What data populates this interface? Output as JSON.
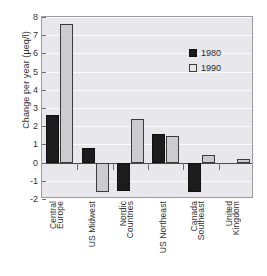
{
  "chart_data": {
    "type": "bar",
    "title": "",
    "xlabel": "",
    "ylabel": "Change per year (µeq/l)",
    "ylim": [
      -2,
      8
    ],
    "ytick_values": [
      8,
      7,
      6,
      5,
      4,
      3,
      2,
      1,
      0,
      -1,
      -2
    ],
    "ytick_labels": [
      "8",
      "7",
      "6",
      "5",
      "4",
      "3",
      "2",
      "1",
      "0",
      "-1",
      "-2"
    ],
    "grid": true,
    "legend_position": "upper right",
    "categories": [
      "Central Europe",
      "US Midwest",
      "Nordic Countries",
      "US Northeast",
      "Canada Southeast",
      "United Kingdom"
    ],
    "category_lines": [
      [
        "Central",
        "Europe"
      ],
      [
        "US Midwest"
      ],
      [
        "Nordic",
        "Countries"
      ],
      [
        "US Northeast"
      ],
      [
        "Canada",
        "Southeast"
      ],
      [
        "United",
        "Kingdom"
      ]
    ],
    "series": [
      {
        "name": "1980",
        "color": "#1c1c1c",
        "values": [
          2.6,
          0.8,
          -1.55,
          1.6,
          -1.6,
          0
        ]
      },
      {
        "name": "1990",
        "color": "#cccccf",
        "values": [
          7.6,
          -1.6,
          2.4,
          1.45,
          0.42,
          0.2
        ]
      }
    ]
  },
  "legend": {
    "items": [
      {
        "label": "1980"
      },
      {
        "label": "1990"
      }
    ]
  },
  "axis": {
    "y_title": "Change per year (µeq/l)"
  },
  "colors": {
    "series_1980": "#1c1c1c",
    "series_1990": "#cccccf",
    "plot_background": "#e7e7ec",
    "gridline": "#fbfbfd",
    "axis_line": "#9a9aa2",
    "zero_line": "#4a4a4a",
    "text": "#2b2b2b"
  }
}
